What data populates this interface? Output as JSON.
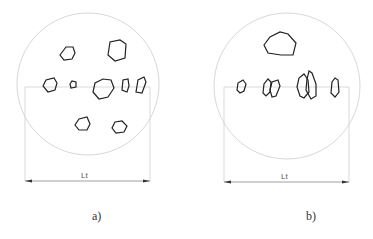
{
  "figure": {
    "panels": [
      {
        "id": "a",
        "caption": "a)",
        "dimension_label": "Lt",
        "description": "Particles scattered throughout circular field"
      },
      {
        "id": "b",
        "caption": "b)",
        "dimension_label": "Lt",
        "description": "Particles aligned along horizontal reference line"
      }
    ]
  },
  "colors": {
    "circle": "#d8d8d8",
    "particle": "#222222",
    "line": "#c8c8c8",
    "dimension": "#555555"
  }
}
